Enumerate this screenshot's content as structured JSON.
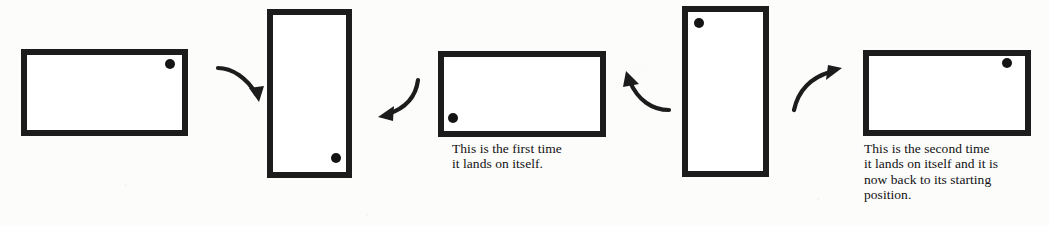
{
  "figure": {
    "background_color": "#fcfcfb",
    "ink_color": "#1c1c1c",
    "width": 1049,
    "height": 226
  },
  "shapes": [
    {
      "name": "rectangle-position-1",
      "orientation": "horizontal",
      "x": 21,
      "y": 49,
      "w": 167,
      "h": 87,
      "border": 6,
      "dot": {
        "cx": 170,
        "cy": 64,
        "r": 5,
        "corner": "top-right"
      },
      "label": "starting position"
    },
    {
      "name": "rectangle-position-2",
      "orientation": "vertical",
      "x": 267,
      "y": 9,
      "w": 85,
      "h": 169,
      "border": 6,
      "dot": {
        "cx": 336,
        "cy": 158,
        "r": 5,
        "corner": "bottom-right"
      },
      "label": "after first quarter turn"
    },
    {
      "name": "rectangle-position-3",
      "orientation": "horizontal",
      "x": 438,
      "y": 51,
      "w": 168,
      "h": 86,
      "border": 6,
      "dot": {
        "cx": 453,
        "cy": 118,
        "r": 5,
        "corner": "bottom-left"
      },
      "label": "first time it lands on itself"
    },
    {
      "name": "rectangle-position-4",
      "orientation": "vertical",
      "x": 682,
      "y": 6,
      "w": 87,
      "h": 171,
      "border": 6,
      "dot": {
        "cx": 699,
        "cy": 23,
        "r": 5,
        "corner": "top-left"
      },
      "label": "after third quarter turn"
    },
    {
      "name": "rectangle-position-5",
      "orientation": "horizontal",
      "x": 863,
      "y": 50,
      "w": 168,
      "h": 86,
      "border": 6,
      "dot": {
        "cx": 1007,
        "cy": 63,
        "r": 5,
        "corner": "top-right"
      },
      "label": "second time it lands on itself"
    }
  ],
  "arrows": [
    {
      "name": "arrow-1",
      "direction": "down-right",
      "x": 214,
      "y": 52,
      "w": 58,
      "h": 58
    },
    {
      "name": "arrow-2",
      "direction": "down-left",
      "x": 368,
      "y": 72,
      "w": 58,
      "h": 58
    },
    {
      "name": "arrow-3",
      "direction": "up-left",
      "x": 612,
      "y": 66,
      "w": 62,
      "h": 58
    },
    {
      "name": "arrow-4",
      "direction": "up-right",
      "x": 788,
      "y": 60,
      "w": 62,
      "h": 60
    }
  ],
  "captions": [
    {
      "name": "caption-first-landing",
      "x": 452,
      "y": 141,
      "text": "This is the first time\nit lands on itself."
    },
    {
      "name": "caption-second-landing",
      "x": 864,
      "y": 141,
      "text": "This is the second time\nit lands on itself and it is\nnow back to its starting\nposition."
    }
  ]
}
